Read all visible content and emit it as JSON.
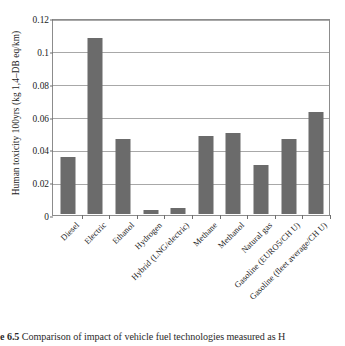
{
  "chart_data": {
    "type": "bar",
    "title": "",
    "xlabel": "",
    "ylabel": "Human toxicity 100yrs (kg 1,4–DB eq/km)",
    "ylim": [
      0,
      0.12
    ],
    "ytick_values": [
      0,
      0.02,
      0.04,
      0.06,
      0.08,
      0.1,
      0.12
    ],
    "ytick_labels": [
      "0",
      "0.02",
      "0.04",
      "0.06",
      "0.08",
      "0.1",
      "0.12"
    ],
    "grid": true,
    "legend": false,
    "bar_color": "#6b6b6b",
    "categories": [
      "Diesel",
      "Electric",
      "Ethanol",
      "Hydrogen",
      "Hybrid (LNG/electric)",
      "Methane",
      "Methanol",
      "Natural gas",
      "Gasoline (EURO5/CH U)",
      "Gasoline (fleet average/CH U)"
    ],
    "values": [
      0.0345,
      0.1075,
      0.0455,
      0.0025,
      0.0035,
      0.0475,
      0.0495,
      0.03,
      0.0457,
      0.062
    ]
  },
  "caption": {
    "number": "e 6.5",
    "text": "Comparison of impact of vehicle fuel technologies measured as H"
  }
}
